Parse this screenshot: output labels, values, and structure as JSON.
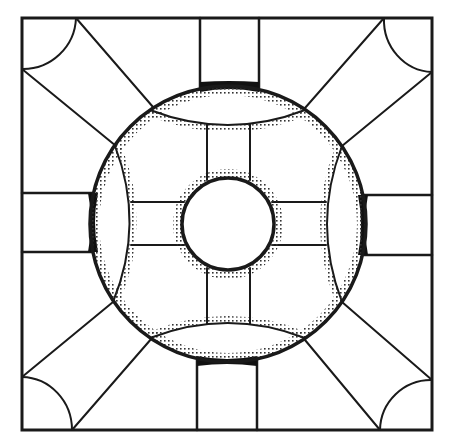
{
  "diagram": {
    "type": "geometric-floor-plan",
    "stroke_color": "#1a1a1a",
    "background": "#ffffff",
    "outer_square": {
      "x1": 22,
      "y1": 18,
      "x2": 432,
      "y2": 430
    },
    "outer_circle": {
      "cx": 228,
      "cy": 224,
      "r": 138
    },
    "inner_circle": {
      "cx": 228,
      "cy": 224,
      "r": 46
    },
    "corner_arc_radius": 52,
    "channels": {
      "top": {
        "x1": 200,
        "x2": 259
      },
      "bottom": {
        "x1": 197,
        "x2": 257
      },
      "left": {
        "y1": 193,
        "y2": 252
      },
      "right": {
        "y1": 195,
        "y2": 255
      }
    },
    "inner_spokes": {
      "vertical": {
        "x1": 207,
        "x2": 250
      },
      "horizontal": {
        "y1": 202,
        "y2": 245
      }
    }
  }
}
